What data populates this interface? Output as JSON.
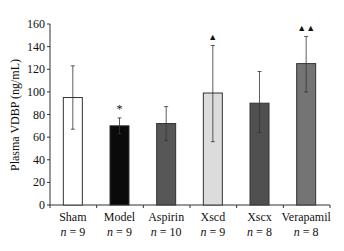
{
  "chart_data": {
    "type": "bar",
    "title": "",
    "xlabel": "",
    "ylabel": "Plasma VDBP (ng/mL)",
    "ylim": [
      0,
      160
    ],
    "yticks": [
      0,
      20,
      40,
      60,
      80,
      100,
      120,
      140,
      160
    ],
    "grid": false,
    "legend": null,
    "categories": [
      "Sham",
      "Model",
      "Aspirin",
      "Xscd",
      "Xscx",
      "Verapamil"
    ],
    "n_labels": [
      "n = 9",
      "n = 9",
      "n = 10",
      "n = 9",
      "n = 8",
      "n = 8"
    ],
    "values": [
      95,
      70,
      72,
      99,
      90,
      125
    ],
    "error_upper": [
      123,
      77,
      87,
      141,
      118,
      149
    ],
    "error_lower": [
      67,
      63,
      57,
      56,
      64,
      100
    ],
    "bar_colors": [
      "#ffffff",
      "#0a0a0a",
      "#575757",
      "#dcdcdc",
      "#505050",
      "#747474"
    ],
    "annotations": [
      "",
      "*",
      "",
      "▲",
      "",
      "▲▲"
    ]
  }
}
